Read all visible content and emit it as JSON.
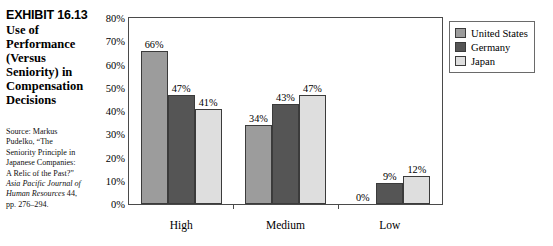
{
  "exhibit": {
    "number": "EXHIBIT 16.13",
    "title_lines": [
      "Use of",
      "Performance",
      "(Versus",
      "Seniority) in",
      "Compensation",
      "Decisions"
    ]
  },
  "source": {
    "line1": "Source: Markus",
    "line2": "Pudelko, “The",
    "line3": "Seniority Principle in",
    "line4": "Japanese Companies:",
    "line5": "A Relic of the Past?”",
    "line6_italic": "Asia Pacific Journal of",
    "line7_italic": "Human Resources",
    "line7_rest": " 44,",
    "line8": "pp. 276–294."
  },
  "legend": {
    "position": "right",
    "items": [
      {
        "label": "United States",
        "color": "#9c9c9c"
      },
      {
        "label": "Germany",
        "color": "#555555"
      },
      {
        "label": "Japan",
        "color": "#dedede"
      }
    ]
  },
  "chart_data": {
    "type": "bar",
    "title": "Use of Performance (Versus Seniority) in Compensation Decisions",
    "xlabel": "",
    "ylabel": "",
    "ylim": [
      0,
      80
    ],
    "grid": false,
    "categories": [
      "High",
      "Medium",
      "Low"
    ],
    "ytick_labels": [
      "0%",
      "10%",
      "20%",
      "30%",
      "40%",
      "50%",
      "60%",
      "70%",
      "80%"
    ],
    "ytick_values": [
      0,
      10,
      20,
      30,
      40,
      50,
      60,
      70,
      80
    ],
    "series": [
      {
        "name": "United States",
        "color": "#9c9c9c",
        "values": [
          66,
          34,
          0
        ],
        "labels": [
          "66%",
          "34%",
          "0%"
        ]
      },
      {
        "name": "Germany",
        "color": "#555555",
        "values": [
          47,
          43,
          9
        ],
        "labels": [
          "47%",
          "43%",
          "9%"
        ]
      },
      {
        "name": "Japan",
        "color": "#dedede",
        "values": [
          41,
          47,
          12
        ],
        "labels": [
          "41%",
          "47%",
          "12%"
        ]
      }
    ]
  }
}
